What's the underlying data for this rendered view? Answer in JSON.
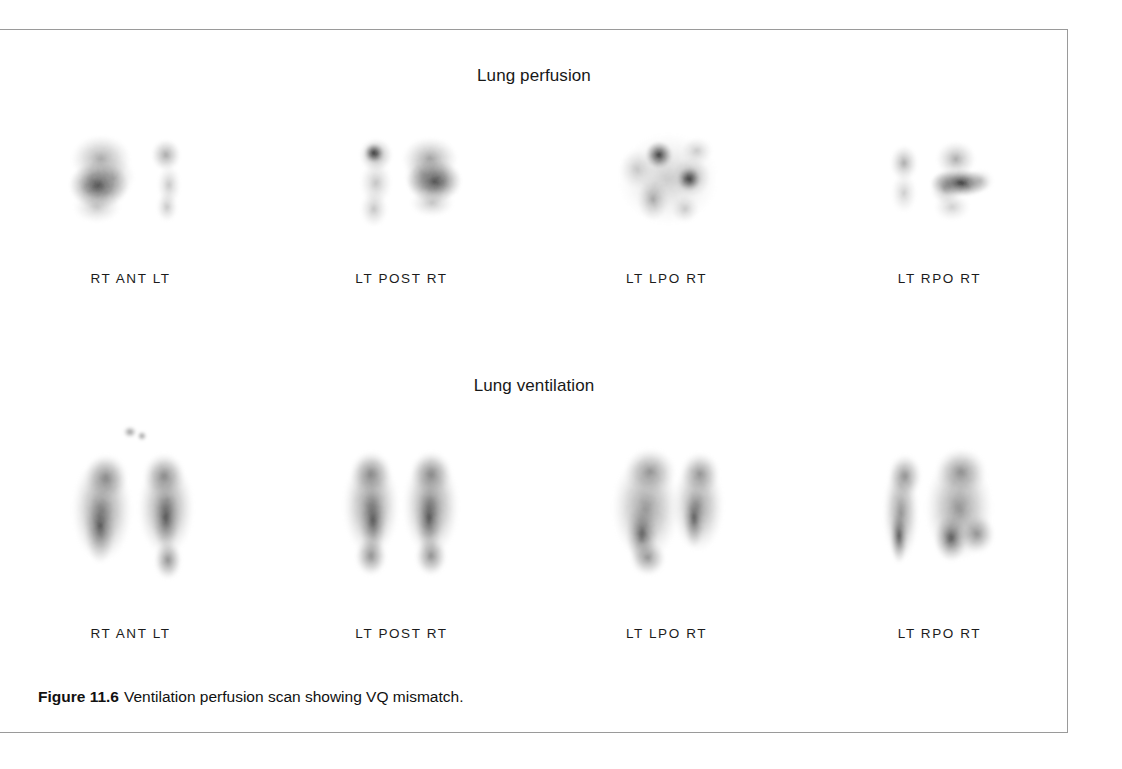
{
  "figure": {
    "caption_label": "Figure 11.6",
    "caption_text": "Ventilation perfusion scan showing VQ mismatch.",
    "frame_color": "#9a9a9a",
    "background_color": "#ffffff",
    "ink_color": "#1a1a1a"
  },
  "sections": [
    {
      "id": "perfusion",
      "heading": "Lung perfusion",
      "panels": [
        {
          "id": "ant",
          "label": "RT  ANT  LT"
        },
        {
          "id": "post",
          "label": "LT POST  RT"
        },
        {
          "id": "lpo",
          "label": "LT  LPO  RT"
        },
        {
          "id": "rpo",
          "label": "LT  RPO  RT"
        }
      ]
    },
    {
      "id": "ventilation",
      "heading": "Lung ventilation",
      "panels": [
        {
          "id": "ant",
          "label": "RT  ANT  LT"
        },
        {
          "id": "post",
          "label": "LT POST  RT"
        },
        {
          "id": "lpo",
          "label": "LT  LPO  RT"
        },
        {
          "id": "rpo",
          "label": "LT  RPO  RT"
        }
      ]
    }
  ],
  "scan_data": {
    "modality": "planar scintigraphy",
    "views": [
      "ANT",
      "POST",
      "LPO",
      "RPO"
    ],
    "finding": "VQ mismatch",
    "perfusion_uptake": "patchy, multiple segmental defects",
    "ventilation_uptake": "uniform, intact lung fields"
  }
}
